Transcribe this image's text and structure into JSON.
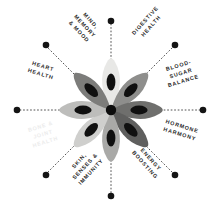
{
  "figure": {
    "name": "wellness-benefit-wheel",
    "background_color": "#ffffff",
    "accent_color": "#141414",
    "center_graphic": {
      "name": "star-anise-flower",
      "petal_count": 8,
      "hub_color": "#0d0d0d",
      "seed_color": "#101010",
      "petal_colors": [
        "#e8e8e6",
        "#8e8e8c",
        "#6f6f6d",
        "#5f5f5e",
        "#a9a9a7",
        "#cfcfcd",
        "#bdbdbb",
        "#7c7c7a"
      ]
    },
    "spoke": {
      "line_color": "#3b3b3b",
      "dot_color": "#141414",
      "count": 8
    }
  },
  "labels": [
    {
      "id": "mind-memory-mood",
      "text": "MIND,\nMEMORY\n& MOOD",
      "angle_deg": 315,
      "faded": false
    },
    {
      "id": "digestive-health",
      "text": "DIGESTIVE\nHEALTH",
      "angle_deg": 45,
      "faded": false
    },
    {
      "id": "blood-sugar-balance",
      "text": "BLOOD-\nSUGAR\nBALANCE",
      "angle_deg": 22,
      "faded": false
    },
    {
      "id": "hormone-harmony",
      "text": "HORMONE\nHARMONY",
      "angle_deg": 158,
      "faded": false
    },
    {
      "id": "energy-boosting",
      "text": "ENERGY\nBOOSTING",
      "angle_deg": 135,
      "faded": false
    },
    {
      "id": "skin-senses-immunity",
      "text": "SKIN,\nSENSES &\nIMMUNITY",
      "angle_deg": 225,
      "faded": false
    },
    {
      "id": "bone-joint-health",
      "text": "BONE &\nJOINT\nHEALTH",
      "angle_deg": 202,
      "faded": true
    },
    {
      "id": "heart-health",
      "text": "HEART\nHEALTH",
      "angle_deg": 338,
      "faded": false
    }
  ]
}
